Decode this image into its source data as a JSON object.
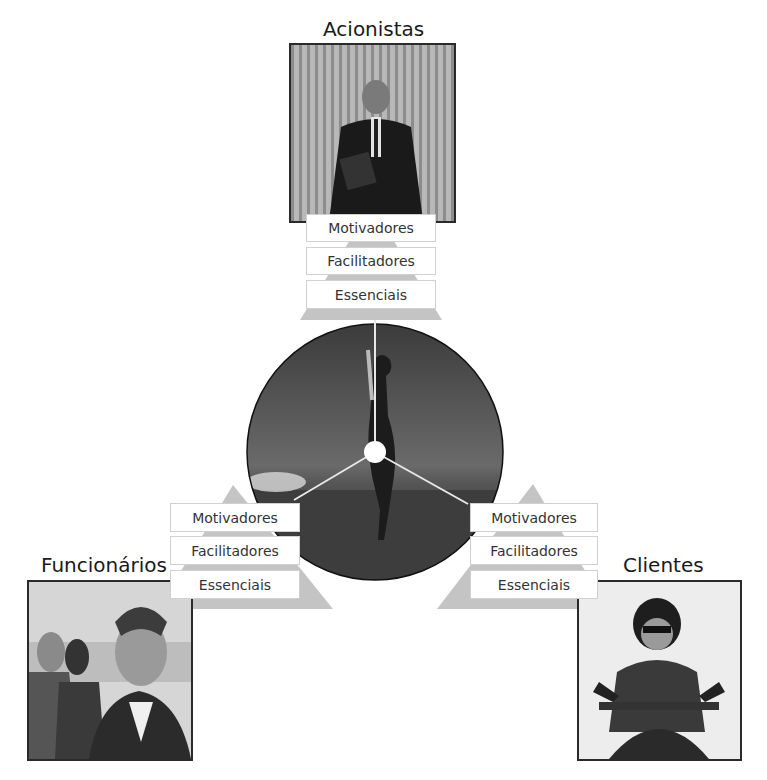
{
  "stakeholders": {
    "top": {
      "title": "Acionistas",
      "photo_icon": "businessman-photo",
      "tiers": [
        "Motivadores",
        "Facilitadores",
        "Essenciais"
      ]
    },
    "left": {
      "title": "Funcionários",
      "photo_icon": "employee-photo",
      "tiers": [
        "Motivadores",
        "Facilitadores",
        "Essenciais"
      ]
    },
    "right": {
      "title": "Clientes",
      "photo_icon": "customer-photo",
      "tiers": [
        "Motivadores",
        "Facilitadores",
        "Essenciais"
      ]
    }
  },
  "center": {
    "image_icon": "jumping-woman-photo",
    "hub": "center-hub"
  },
  "colors": {
    "pyramid": "#c4c4c4",
    "box_border": "#d0d0d0",
    "photo_border": "#2a2a2a"
  }
}
